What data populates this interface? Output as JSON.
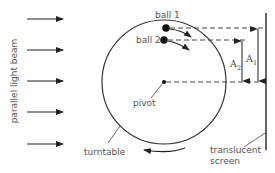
{
  "labels": {
    "beam": "parallel light beam",
    "ball1": "ball 1",
    "ball2": "ball 2",
    "pivot": "pivot",
    "turntable": "turntable",
    "screen_line1": "translucent",
    "screen_line2": "screen",
    "amp1_main": "A",
    "amp1_sub": "1",
    "amp2_main": "A",
    "amp2_sub": "2"
  },
  "beam_arrows_y": [
    19,
    50,
    81,
    112,
    144
  ],
  "colors": {
    "line": "#333333",
    "text": "#555555",
    "background": "#ffffff"
  }
}
